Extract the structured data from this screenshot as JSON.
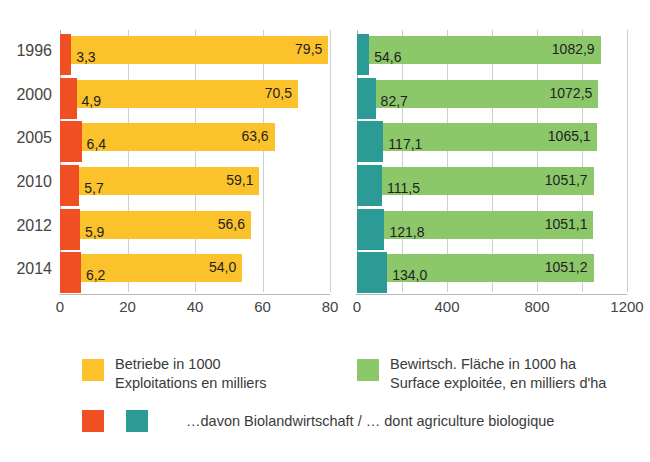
{
  "clipped_header": "",
  "chart_data": {
    "type": "bar",
    "orientation": "horizontal",
    "title": "",
    "categories": [
      "1996",
      "2000",
      "2005",
      "2010",
      "2012",
      "2014"
    ],
    "panels": [
      {
        "id": "farms",
        "xlabel": "",
        "xlim": [
          0,
          80
        ],
        "xticks": [
          "0",
          "20",
          "40",
          "60",
          "80"
        ],
        "xtick_values": [
          0,
          20,
          40,
          60,
          80
        ],
        "grid": true,
        "series": [
          {
            "name": "Betriebe in 1000",
            "name_fr": "Exploitations en milliers",
            "color": "#fbc22c",
            "values": [
              79.5,
              70.5,
              63.6,
              59.1,
              56.6,
              54.0
            ],
            "labels": [
              "79,5",
              "70,5",
              "63,6",
              "59,1",
              "56,6",
              "54,0"
            ]
          },
          {
            "name": "...davon Biolandwirtschaft",
            "name_fr": "... dont agriculture biologique",
            "color": "#f04e23",
            "values": [
              3.3,
              4.9,
              6.4,
              5.7,
              5.9,
              6.2
            ],
            "labels": [
              "3,3",
              "4,9",
              "6,4",
              "5,7",
              "5,9",
              "6,2"
            ]
          }
        ]
      },
      {
        "id": "area",
        "xlabel": "",
        "xlim": [
          0,
          1200
        ],
        "xticks": [
          "0",
          "400",
          "800",
          "1200"
        ],
        "xtick_values": [
          0,
          400,
          800,
          1200
        ],
        "minor_tick_values": [
          200,
          600,
          1000
        ],
        "grid": true,
        "series": [
          {
            "name": "Bewirtsch. Fläche in 1000 ha",
            "name_fr": "Surface exploitée, en milliers d'ha",
            "color": "#8cc76a",
            "values": [
              1082.9,
              1072.5,
              1065.1,
              1051.7,
              1051.1,
              1051.2
            ],
            "labels": [
              "1082,9",
              "1072,5",
              "1065,1",
              "1051,7",
              "1051,1",
              "1051,2"
            ]
          },
          {
            "name": "...davon Biolandwirtschaft",
            "name_fr": "... dont agriculture biologique",
            "color": "#2c9a95",
            "values": [
              54.6,
              82.7,
              117.1,
              111.5,
              121.8,
              134.0
            ],
            "labels": [
              "54,6",
              "82,7",
              "117,1",
              "111,5",
              "121,8",
              "134,0"
            ]
          }
        ]
      }
    ]
  },
  "legend": {
    "entries": [
      {
        "swatch_color": "#fbc22c",
        "line1": "Betriebe in 1000",
        "line2": "Exploitations en milliers"
      },
      {
        "swatch_color": "#8cc76a",
        "line1": "Bewirtsch. Fläche in 1000 ha",
        "line2": "Surface exploitée, en milliers d'ha"
      }
    ],
    "organic": {
      "swatch_color_1": "#f04e23",
      "swatch_color_2": "#2c9a95",
      "text": "…davon Biolandwirtschaft / … dont agriculture biologique"
    }
  }
}
